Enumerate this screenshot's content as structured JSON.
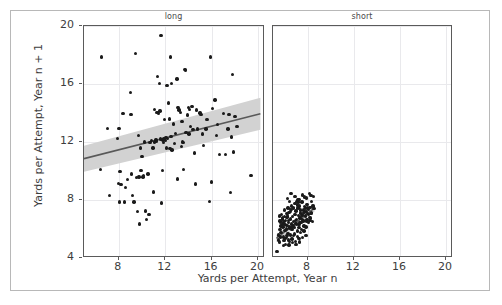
{
  "chart_data": {
    "type": "scatter",
    "title": "",
    "xlabel": "Yards per Attempt, Year n",
    "ylabel": "Yards per Attempt, Year n + 1",
    "xlim": [
      5.0,
      20.6
    ],
    "ylim": [
      4,
      20
    ],
    "xticks": [
      8,
      12,
      16,
      20
    ],
    "yticks": [
      4,
      8,
      12,
      16,
      20
    ],
    "xtick_labels": [
      "8",
      "12",
      "16",
      "20"
    ],
    "ytick_labels": [
      "4",
      "8",
      "12",
      "16",
      "20"
    ],
    "grid": true,
    "legend": "none",
    "facet_variable": "pass_length",
    "marker_color": "#1a1a1a",
    "line_color": "#595959",
    "band_color": "#d2d2d2",
    "panels": [
      {
        "label": "long",
        "n_points": 120,
        "regression": {
          "x_start": 5.0,
          "y_start": 10.85,
          "x_end": 20.2,
          "y_end": 13.95,
          "ci_lower_start": 9.95,
          "ci_upper_start": 11.75,
          "ci_lower_end": 12.85,
          "ci_upper_end": 15.05
        },
        "points": [
          [
            6.5,
            17.85
          ],
          [
            6.4,
            10.1
          ],
          [
            7.05,
            12.95
          ],
          [
            7.2,
            8.3
          ],
          [
            7.9,
            12.25
          ],
          [
            7.95,
            9.15
          ],
          [
            8.0,
            12.95
          ],
          [
            8.1,
            9.95
          ],
          [
            8.05,
            7.85
          ],
          [
            8.2,
            9.05
          ],
          [
            8.35,
            13.95
          ],
          [
            8.5,
            7.85
          ],
          [
            8.6,
            8.85
          ],
          [
            8.75,
            9.4
          ],
          [
            9.0,
            15.4
          ],
          [
            9.05,
            13.9
          ],
          [
            9.1,
            9.8
          ],
          [
            9.2,
            8.3
          ],
          [
            9.3,
            7.85
          ],
          [
            9.45,
            18.1
          ],
          [
            9.55,
            9.55
          ],
          [
            9.6,
            7.2
          ],
          [
            9.7,
            12.45
          ],
          [
            9.75,
            9.6
          ],
          [
            9.8,
            6.35
          ],
          [
            9.85,
            11.6
          ],
          [
            9.9,
            10.05
          ],
          [
            10.0,
            11.0
          ],
          [
            10.1,
            9.6
          ],
          [
            10.15,
            9.7
          ],
          [
            10.2,
            12.0
          ],
          [
            10.3,
            7.25
          ],
          [
            10.4,
            6.65
          ],
          [
            10.5,
            9.8
          ],
          [
            10.6,
            7.0
          ],
          [
            10.7,
            11.95
          ],
          [
            10.8,
            12.1
          ],
          [
            11.0,
            8.55
          ],
          [
            11.05,
            14.25
          ],
          [
            11.1,
            12.0
          ],
          [
            11.2,
            12.15
          ],
          [
            11.3,
            14.05
          ],
          [
            11.35,
            16.5
          ],
          [
            11.4,
            13.95
          ],
          [
            11.5,
            16.05
          ],
          [
            11.55,
            14.15
          ],
          [
            11.6,
            12.2
          ],
          [
            11.65,
            19.35
          ],
          [
            11.7,
            7.8
          ],
          [
            11.75,
            10.05
          ],
          [
            11.8,
            12.15
          ],
          [
            11.85,
            11.95
          ],
          [
            11.9,
            12.2
          ],
          [
            11.95,
            13.55
          ],
          [
            12.0,
            12.1
          ],
          [
            12.05,
            12.3
          ],
          [
            12.1,
            11.6
          ],
          [
            12.15,
            15.9
          ],
          [
            12.2,
            12.25
          ],
          [
            12.3,
            14.7
          ],
          [
            12.4,
            11.55
          ],
          [
            12.45,
            17.85
          ],
          [
            12.5,
            12.4
          ],
          [
            12.55,
            16.05
          ],
          [
            12.6,
            11.45
          ],
          [
            12.7,
            13.25
          ],
          [
            12.8,
            11.9
          ],
          [
            12.9,
            12.6
          ],
          [
            13.0,
            16.35
          ],
          [
            13.05,
            9.45
          ],
          [
            13.1,
            14.4
          ],
          [
            13.2,
            14.2
          ],
          [
            13.3,
            14.05
          ],
          [
            13.4,
            11.7
          ],
          [
            13.5,
            12.0
          ],
          [
            13.55,
            11.95
          ],
          [
            13.6,
            10.1
          ],
          [
            13.7,
            17.0
          ],
          [
            13.75,
            16.95
          ],
          [
            13.8,
            12.65
          ],
          [
            13.9,
            13.85
          ],
          [
            14.0,
            14.4
          ],
          [
            14.05,
            12.55
          ],
          [
            14.1,
            14.25
          ],
          [
            14.2,
            13.05
          ],
          [
            14.3,
            14.45
          ],
          [
            14.4,
            12.85
          ],
          [
            14.5,
            11.25
          ],
          [
            14.6,
            9.1
          ],
          [
            14.7,
            14.2
          ],
          [
            14.8,
            12.9
          ],
          [
            15.0,
            14.0
          ],
          [
            15.1,
            13.9
          ],
          [
            15.2,
            12.55
          ],
          [
            15.3,
            11.75
          ],
          [
            15.5,
            12.9
          ],
          [
            15.6,
            13.55
          ],
          [
            15.8,
            7.9
          ],
          [
            15.9,
            17.85
          ],
          [
            16.0,
            9.25
          ],
          [
            16.1,
            14.3
          ],
          [
            16.3,
            14.9
          ],
          [
            16.4,
            12.45
          ],
          [
            16.5,
            13.2
          ],
          [
            16.7,
            11.15
          ],
          [
            17.0,
            13.95
          ],
          [
            17.2,
            11.15
          ],
          [
            17.4,
            12.9
          ],
          [
            17.5,
            13.9
          ],
          [
            17.6,
            8.5
          ],
          [
            17.7,
            12.35
          ],
          [
            17.8,
            16.65
          ],
          [
            17.9,
            11.3
          ],
          [
            18.0,
            13.75
          ],
          [
            18.2,
            13.05
          ],
          [
            19.4,
            9.7
          ],
          [
            12.35,
            13.6
          ],
          [
            13.45,
            13.4
          ],
          [
            11.25,
            12.05
          ],
          [
            10.95,
            11.6
          ]
        ]
      },
      {
        "label": "short",
        "n_points": 140,
        "regression": {
          "x_start": 5.3,
          "y_start": 5.35,
          "x_end": 8.6,
          "y_end": 7.45,
          "ci_lower_start": 5.1,
          "ci_upper_start": 5.6,
          "ci_lower_end": 7.2,
          "ci_upper_end": 7.7
        },
        "points": [
          [
            5.35,
            4.45
          ],
          [
            5.5,
            5.25
          ],
          [
            5.55,
            5.1
          ],
          [
            5.6,
            6.55
          ],
          [
            5.65,
            6.45
          ],
          [
            5.7,
            5.75
          ],
          [
            5.75,
            6.2
          ],
          [
            5.8,
            6.7
          ],
          [
            5.85,
            6.15
          ],
          [
            5.9,
            5.45
          ],
          [
            5.95,
            6.5
          ],
          [
            6.0,
            6.85
          ],
          [
            6.05,
            5.9
          ],
          [
            6.1,
            6.6
          ],
          [
            6.15,
            7.05
          ],
          [
            6.2,
            6.25
          ],
          [
            6.25,
            6.9
          ],
          [
            6.3,
            5.7
          ],
          [
            6.35,
            6.45
          ],
          [
            6.4,
            7.15
          ],
          [
            6.45,
            6.05
          ],
          [
            6.5,
            6.7
          ],
          [
            6.55,
            7.35
          ],
          [
            6.6,
            6.35
          ],
          [
            6.65,
            5.95
          ],
          [
            6.7,
            6.85
          ],
          [
            6.75,
            7.5
          ],
          [
            6.8,
            6.5
          ],
          [
            6.85,
            6.1
          ],
          [
            6.9,
            7.0
          ],
          [
            6.95,
            6.4
          ],
          [
            7.0,
            7.25
          ],
          [
            7.05,
            6.65
          ],
          [
            7.1,
            5.85
          ],
          [
            7.15,
            7.45
          ],
          [
            7.2,
            6.95
          ],
          [
            7.25,
            6.3
          ],
          [
            7.3,
            7.6
          ],
          [
            7.35,
            6.75
          ],
          [
            7.4,
            7.1
          ],
          [
            7.45,
            6.45
          ],
          [
            7.5,
            7.85
          ],
          [
            7.55,
            7.0
          ],
          [
            7.6,
            6.6
          ],
          [
            7.65,
            7.3
          ],
          [
            7.7,
            6.2
          ],
          [
            7.75,
            7.55
          ],
          [
            7.8,
            6.9
          ],
          [
            7.85,
            7.2
          ],
          [
            7.9,
            6.55
          ],
          [
            7.95,
            7.7
          ],
          [
            8.0,
            7.05
          ],
          [
            8.05,
            6.45
          ],
          [
            8.1,
            7.35
          ],
          [
            8.15,
            6.8
          ],
          [
            8.2,
            7.5
          ],
          [
            8.25,
            6.6
          ],
          [
            8.3,
            8.3
          ],
          [
            8.35,
            7.15
          ],
          [
            8.4,
            6.5
          ],
          [
            8.45,
            7.6
          ],
          [
            8.5,
            8.25
          ],
          [
            8.55,
            7.4
          ],
          [
            5.45,
            5.6
          ],
          [
            5.6,
            5.95
          ],
          [
            5.95,
            5.2
          ],
          [
            6.05,
            5.35
          ],
          [
            6.2,
            5.55
          ],
          [
            6.35,
            5.25
          ],
          [
            6.5,
            5.6
          ],
          [
            6.65,
            5.3
          ],
          [
            6.8,
            5.55
          ],
          [
            6.95,
            5.15
          ],
          [
            7.1,
            5.5
          ],
          [
            7.25,
            5.35
          ],
          [
            7.4,
            5.75
          ],
          [
            7.55,
            5.4
          ],
          [
            7.7,
            5.85
          ],
          [
            7.85,
            5.55
          ],
          [
            6.25,
            8.1
          ],
          [
            6.55,
            8.45
          ],
          [
            6.9,
            8.25
          ],
          [
            7.25,
            8.05
          ],
          [
            7.55,
            8.35
          ],
          [
            7.9,
            8.15
          ],
          [
            8.15,
            8.45
          ],
          [
            5.75,
            7.0
          ],
          [
            5.85,
            6.4
          ],
          [
            6.0,
            7.3
          ],
          [
            6.15,
            6.0
          ],
          [
            6.3,
            7.45
          ],
          [
            6.45,
            6.15
          ],
          [
            6.6,
            7.6
          ],
          [
            6.75,
            6.25
          ],
          [
            6.9,
            7.75
          ],
          [
            7.05,
            6.35
          ],
          [
            7.2,
            7.85
          ],
          [
            7.35,
            6.45
          ],
          [
            7.5,
            6.95
          ],
          [
            7.65,
            6.55
          ],
          [
            7.8,
            7.45
          ],
          [
            7.95,
            6.65
          ],
          [
            8.1,
            7.0
          ],
          [
            8.25,
            6.75
          ],
          [
            6.1,
            4.95
          ],
          [
            6.4,
            4.9
          ],
          [
            6.7,
            5.05
          ],
          [
            7.0,
            4.95
          ],
          [
            7.3,
            5.1
          ],
          [
            5.9,
            4.85
          ],
          [
            6.15,
            5.4
          ],
          [
            6.45,
            5.15
          ],
          [
            6.05,
            6.3
          ],
          [
            6.35,
            6.6
          ],
          [
            6.65,
            6.1
          ],
          [
            6.95,
            6.6
          ],
          [
            7.25,
            6.1
          ],
          [
            7.55,
            6.65
          ],
          [
            7.85,
            6.15
          ],
          [
            8.15,
            6.6
          ],
          [
            5.7,
            6.2
          ],
          [
            5.8,
            6.75
          ],
          [
            6.2,
            6.8
          ],
          [
            6.5,
            7.2
          ],
          [
            6.8,
            7.4
          ],
          [
            7.1,
            7.65
          ],
          [
            7.4,
            7.3
          ],
          [
            7.7,
            7.15
          ],
          [
            8.0,
            7.45
          ],
          [
            8.3,
            7.05
          ],
          [
            5.55,
            6.9
          ],
          [
            5.65,
            5.45
          ],
          [
            6.45,
            7.9
          ],
          [
            7.15,
            8.0
          ],
          [
            7.75,
            8.2
          ],
          [
            8.35,
            7.9
          ],
          [
            6.25,
            7.05
          ],
          [
            7.05,
            7.9
          ],
          [
            6.85,
            5.65
          ],
          [
            7.45,
            5.95
          ]
        ]
      }
    ]
  }
}
